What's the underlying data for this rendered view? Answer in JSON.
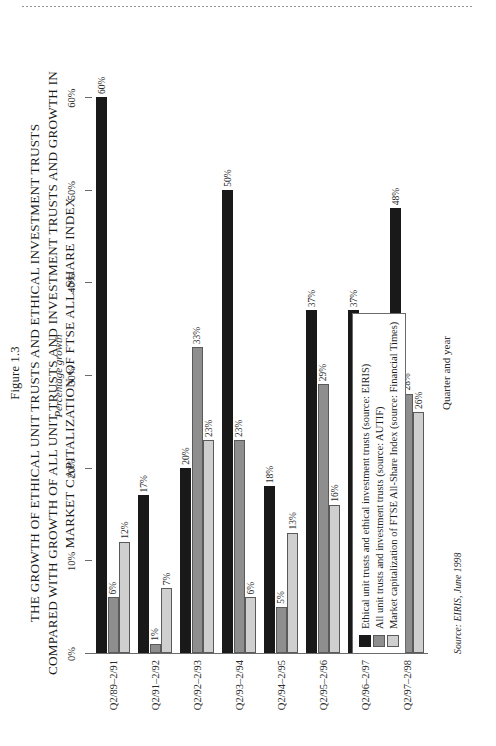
{
  "figure": {
    "number": "Figure 1.3",
    "title_lines": [
      "THE GROWTH OF ETHICAL UNIT TRUSTS AND ETHICAL INVESTMENT TRUSTS",
      "COMPARED WITH GROWTH OF ALL UNIT TRUSTS AND INVESTMENT TRUSTS AND GROWTH IN",
      "MARKET CAPITALIZATION OF FTSE ALL-SHARE INDEX"
    ],
    "source_note": "Source: EIRIS, June 1998"
  },
  "colors": {
    "series_0": "#191919",
    "series_1": "#8e8e8e",
    "series_2": "#cfcfcf",
    "axis": "#6b6b6b",
    "page": "#ffffff"
  },
  "legend": {
    "items": [
      {
        "swatch": "series_0",
        "label": "Ethical unit trusts and ethical investment trusts (source: EIRIS)"
      },
      {
        "swatch": "series_1",
        "label": "All unit trusts and investment trusts (source: AUTIF)"
      },
      {
        "swatch": "series_2",
        "label": "Market capitalization of FTSE All-Share Index (source: Financial Times)"
      }
    ]
  },
  "chart_data": {
    "type": "bar",
    "title": "THE GROWTH OF ETHICAL UNIT TRUSTS AND ETHICAL INVESTMENT TRUSTS COMPARED WITH GROWTH OF ALL UNIT TRUSTS AND INVESTMENT TRUSTS AND GROWTH IN MARKET CAPITALIZATION OF FTSE ALL-SHARE INDEX",
    "subtitle": "Figure 1.3",
    "xlabel": "Quarter and year",
    "ylabel": "Percentage growth",
    "orientation": "vertical",
    "grid": false,
    "legend_position": "bottom",
    "ylim": [
      0,
      60
    ],
    "yticks": [
      0,
      10,
      20,
      30,
      40,
      50,
      60
    ],
    "ytick_labels": [
      "0%",
      "10%",
      "20%",
      "30%",
      "40%",
      "50%",
      "60%"
    ],
    "categories": [
      "Q2/89–2/91",
      "Q2/91–2/92",
      "Q2/92–2/93",
      "Q2/93–2/94",
      "Q2/94–2/95",
      "Q2/95–2/96",
      "Q2/96–2/97",
      "Q2/97–2/98"
    ],
    "series": [
      {
        "name": "Ethical unit trusts and ethical investment trusts (source: EIRIS)",
        "color": "#191919",
        "values": [
          60,
          17,
          20,
          50,
          18,
          37,
          37,
          48
        ],
        "labels": [
          "60%",
          "17%",
          "20%",
          "50%",
          "18%",
          "37%",
          "37%",
          "48%"
        ]
      },
      {
        "name": "All unit trusts and investment trusts (source: AUTIF)",
        "color": "#8e8e8e",
        "values": [
          6,
          1,
          33,
          23,
          5,
          29,
          13,
          28
        ],
        "labels": [
          "6%",
          "1%",
          "33%",
          "23%",
          "5%",
          "29%",
          "13%",
          "28%"
        ]
      },
      {
        "name": "Market capitalization of FTSE All-Share Index (source: Financial Times)",
        "color": "#cfcfcf",
        "values": [
          12,
          7,
          23,
          6,
          13,
          16,
          22,
          26
        ],
        "labels": [
          "12%",
          "7%",
          "23%",
          "6%",
          "13%",
          "16%",
          "22%",
          "26%"
        ]
      }
    ]
  }
}
